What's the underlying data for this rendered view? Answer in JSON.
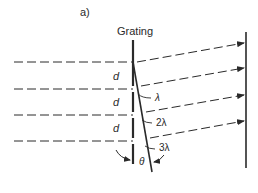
{
  "panel_label": "a)",
  "grating_label": "Grating",
  "spacing_labels": [
    "d",
    "d",
    "d"
  ],
  "path_difference_labels": [
    "λ",
    "2λ",
    "3λ"
  ],
  "angle_label": "θ",
  "colors": {
    "ink": "#2a2a2a",
    "background": "#ffffff"
  }
}
